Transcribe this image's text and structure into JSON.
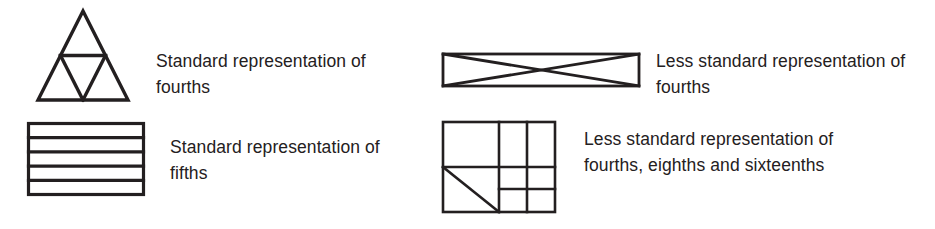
{
  "page": {
    "background_color": "#ffffff",
    "ink_color": "#231f20",
    "width": 935,
    "height": 229
  },
  "items": [
    {
      "id": "fourths-triangle",
      "figure_name": "triangle-divided-into-fourths",
      "caption": "Standard representation of fourths",
      "shape": "triangle",
      "parts": 4,
      "fraction": "fourths"
    },
    {
      "id": "fifths-bars",
      "figure_name": "rectangle-divided-into-fifths",
      "caption": "Standard representation of fifths",
      "shape": "rectangle-horizontal-strips",
      "parts": 5,
      "fraction": "fifths"
    },
    {
      "id": "fourths-x",
      "figure_name": "rectangle-divided-by-diagonals-into-fourths",
      "caption": "Less standard representation of fourths",
      "shape": "rectangle-with-x-diagonals",
      "parts": 4,
      "fraction": "fourths"
    },
    {
      "id": "mixed-grid",
      "figure_name": "rectangle-divided-into-fourths-eighths-sixteenths",
      "caption": "Less standard representation of fourths, eighths and sixteenths",
      "shape": "rectangle-nested-grid-with-diagonal",
      "parts": 16,
      "fraction": "fourths, eighths and sixteenths"
    }
  ]
}
